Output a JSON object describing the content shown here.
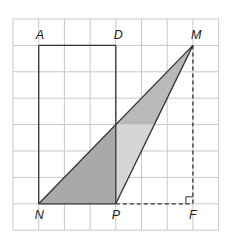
{
  "grid": {
    "columns": 8,
    "rows": 8,
    "origin_x": 13,
    "origin_y": 19,
    "cell_w": 25.7,
    "cell_h": 26.4,
    "line_color": "#c8c8c8"
  },
  "points": [
    {
      "name": "A",
      "col": 1,
      "row": 1,
      "label_dx": -3,
      "label_dy": -6
    },
    {
      "name": "D",
      "col": 4,
      "row": 1,
      "label_dx": -2,
      "label_dy": -6
    },
    {
      "name": "M",
      "col": 7,
      "row": 1,
      "label_dx": -2,
      "label_dy": -6
    },
    {
      "name": "N",
      "col": 1,
      "row": 7,
      "label_dx": -4,
      "label_dy": 15
    },
    {
      "name": "P",
      "col": 4,
      "row": 7,
      "label_dx": -4,
      "label_dy": 15
    },
    {
      "name": "F",
      "col": 7,
      "row": 7,
      "label_dx": -4,
      "label_dy": 15
    }
  ],
  "labels": {
    "A": "A",
    "D": "D",
    "M": "M",
    "N": "N",
    "P": "P",
    "F": "F"
  },
  "segments": {
    "solid": [
      [
        "A",
        "D"
      ],
      [
        "A",
        "N"
      ],
      [
        "D",
        "P"
      ],
      [
        "N",
        "M"
      ],
      [
        "P",
        "M"
      ],
      [
        "N",
        "P"
      ]
    ],
    "dashed": [
      [
        "M",
        "F"
      ],
      [
        "P",
        "F"
      ]
    ]
  },
  "regions": {
    "left_dark": {
      "color": "#a9a9a9"
    },
    "upper_medium": {
      "color": "#b9b9b9"
    },
    "lower_light": {
      "color": "#d6d6d6"
    }
  },
  "right_angle_at": "F"
}
